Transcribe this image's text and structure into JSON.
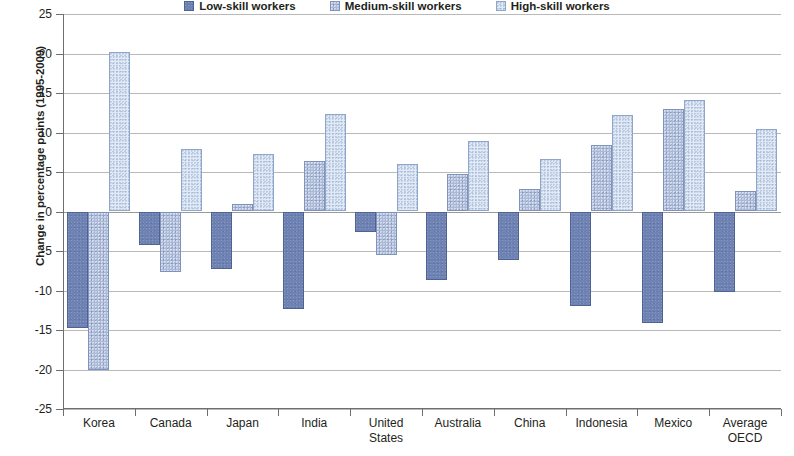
{
  "chart_data": {
    "type": "bar",
    "title": "",
    "subtitle": "",
    "xlabel": "",
    "ylabel": "Change in percentage points (1995-2009)",
    "ylim": [
      -25,
      25
    ],
    "ytick_labels": [
      "25",
      "20",
      "15",
      "10",
      "5",
      "0",
      "-5",
      "-10",
      "-15",
      "-20",
      "-25"
    ],
    "ytick_values": [
      25,
      20,
      15,
      10,
      5,
      0,
      -5,
      -10,
      -15,
      -20,
      -25
    ],
    "grid": true,
    "legend_position": "top-center",
    "categories": [
      "Korea",
      "Canada",
      "Japan",
      "India",
      "United\nStates",
      "Australia",
      "China",
      "Indonesia",
      "Mexico",
      "Average\nOECD"
    ],
    "series": [
      {
        "name": "Low-skill workers",
        "color": "#6e82b3",
        "values": [
          -14.8,
          -4.3,
          -7.3,
          -12.3,
          -2.6,
          -8.7,
          -6.2,
          -11.9,
          -14.1,
          -10.2
        ]
      },
      {
        "name": "Medium-skill workers",
        "color": "#aab9d8",
        "values": [
          -20.0,
          -7.7,
          0.9,
          6.4,
          -5.5,
          4.8,
          2.8,
          8.4,
          13.0,
          2.6
        ]
      },
      {
        "name": "High-skill workers",
        "color": "#e2eaf5",
        "values": [
          20.2,
          7.9,
          7.3,
          12.4,
          6.0,
          8.9,
          6.7,
          12.2,
          14.1,
          10.4
        ]
      }
    ]
  }
}
